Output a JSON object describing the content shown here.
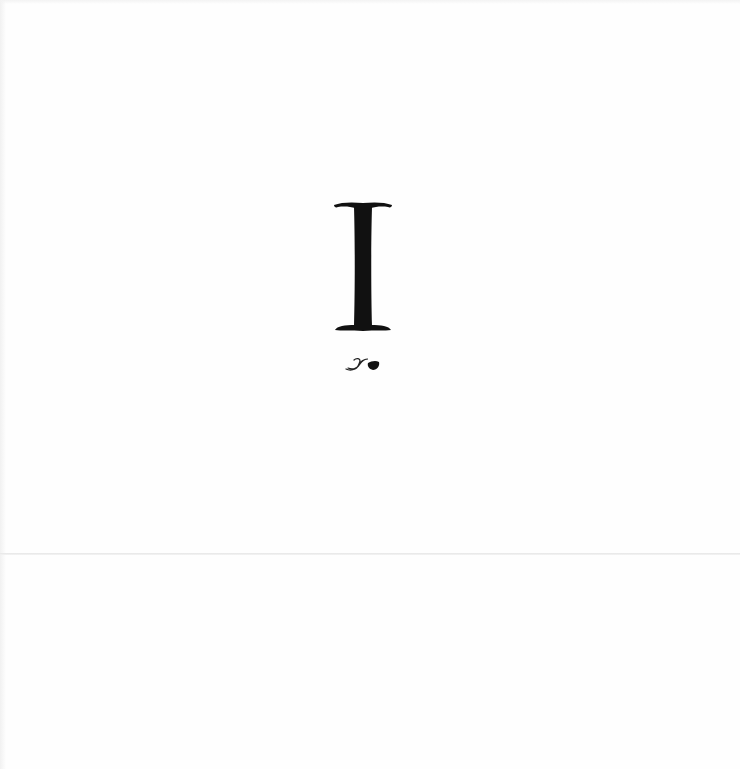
{
  "page": {
    "chapter_numeral": "I",
    "ornament": "fleuron-icon",
    "colors": {
      "background": "#fefefe",
      "ink": "#111111",
      "fold_line": "#e6e6e6"
    }
  }
}
